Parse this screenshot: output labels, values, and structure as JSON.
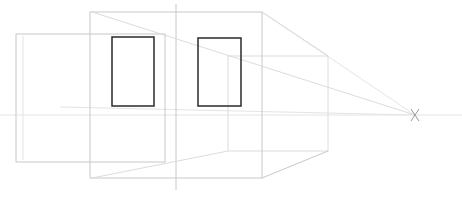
{
  "drawing": {
    "title": "One-point perspective box sketch",
    "vanishing_point": {
      "label": "X",
      "x": 415,
      "y": 115
    },
    "horizon_line": {
      "y": 115,
      "x1": 0,
      "x2": 462
    },
    "vertical_guide": {
      "x": 176,
      "y1": 4,
      "y2": 190
    },
    "front_face": {
      "x": 90,
      "y": 12,
      "width": 172,
      "height": 166
    },
    "back_face": {
      "x": 228,
      "y": 56,
      "width": 100,
      "height": 95
    },
    "left_panel": {
      "x": 16,
      "y": 34,
      "width": 149,
      "height": 128
    },
    "windows": [
      {
        "name": "window-left",
        "x": 112,
        "y": 37,
        "width": 42,
        "height": 69
      },
      {
        "name": "window-right",
        "x": 198,
        "y": 38,
        "width": 43,
        "height": 68
      }
    ],
    "colors": {
      "background": "#ffffff",
      "window_stroke": "#2a2a2a",
      "construction_stroke": "#c8c8c8",
      "guide_stroke": "#e4e4e4"
    }
  }
}
